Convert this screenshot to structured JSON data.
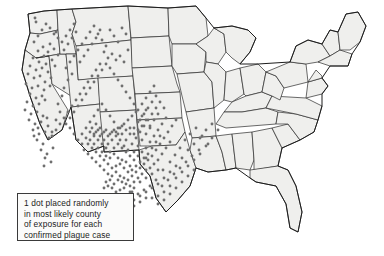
{
  "figure": {
    "kind": "choropleth-dot-map",
    "region": "Contiguous United States",
    "background_color": "#ffffff",
    "state_fill_color": "#efefed",
    "state_border_color": "#2b2b2b",
    "dot_color": "#6f6f6f"
  },
  "legend": {
    "box_border_color": "#3a3a3a",
    "box_fill_color": "#fbfbfa",
    "line1": "1 dot placed randomly",
    "line2": "in most likely county",
    "line3": "of exposure for each",
    "line4": "confirmed plague case"
  },
  "chart_data": {
    "type": "scatter",
    "title": "",
    "xlabel": "",
    "ylabel": "",
    "units": "1 dot = 1 confirmed plague case",
    "total_dots": 392,
    "xlim": [
      0,
      384
    ],
    "ylim": [
      0,
      256
    ],
    "grid": false,
    "legend_position": "bottom-left",
    "clusters": [
      {
        "name": "Four Corners / New Mexico-Arizona-Colorado core",
        "dot_count": 243
      },
      {
        "name": "California coastal and Sierra",
        "dot_count": 63
      },
      {
        "name": "Oregon / Washington",
        "dot_count": 18
      },
      {
        "name": "Nevada / Utah / Idaho",
        "dot_count": 24
      },
      {
        "name": "Montana / Wyoming",
        "dot_count": 14
      },
      {
        "name": "Texas / Oklahoma outliers",
        "dot_count": 8
      }
    ],
    "points": [
      [
        35,
        18
      ],
      [
        36,
        22
      ],
      [
        56,
        32
      ],
      [
        50,
        44
      ],
      [
        43,
        47
      ],
      [
        38,
        51
      ],
      [
        48,
        52
      ],
      [
        54,
        49
      ],
      [
        44,
        56
      ],
      [
        58,
        55
      ],
      [
        33,
        58
      ],
      [
        39,
        62
      ],
      [
        46,
        64
      ],
      [
        52,
        60
      ],
      [
        30,
        66
      ],
      [
        36,
        70
      ],
      [
        42,
        68
      ],
      [
        48,
        72
      ],
      [
        55,
        66
      ],
      [
        28,
        74
      ],
      [
        34,
        78
      ],
      [
        40,
        76
      ],
      [
        45,
        82
      ],
      [
        51,
        78
      ],
      [
        26,
        84
      ],
      [
        32,
        88
      ],
      [
        38,
        86
      ],
      [
        44,
        90
      ],
      [
        50,
        86
      ],
      [
        30,
        94
      ],
      [
        36,
        98
      ],
      [
        42,
        96
      ],
      [
        27,
        102
      ],
      [
        33,
        106
      ],
      [
        39,
        104
      ],
      [
        45,
        100
      ],
      [
        25,
        110
      ],
      [
        31,
        114
      ],
      [
        37,
        112
      ],
      [
        43,
        116
      ],
      [
        29,
        120
      ],
      [
        35,
        124
      ],
      [
        41,
        122
      ],
      [
        47,
        118
      ],
      [
        33,
        130
      ],
      [
        39,
        134
      ],
      [
        45,
        132
      ],
      [
        37,
        140
      ],
      [
        43,
        144
      ],
      [
        49,
        138
      ],
      [
        41,
        150
      ],
      [
        47,
        154
      ],
      [
        53,
        148
      ],
      [
        45,
        158
      ],
      [
        51,
        162
      ],
      [
        44,
        166
      ],
      [
        38,
        128
      ],
      [
        34,
        136
      ],
      [
        48,
        126
      ],
      [
        52,
        132
      ],
      [
        56,
        120
      ],
      [
        60,
        112
      ],
      [
        58,
        104
      ],
      [
        62,
        96
      ],
      [
        64,
        88
      ],
      [
        68,
        80
      ],
      [
        72,
        74
      ],
      [
        66,
        68
      ],
      [
        70,
        62
      ],
      [
        74,
        56
      ],
      [
        78,
        50
      ],
      [
        82,
        44
      ],
      [
        86,
        38
      ],
      [
        90,
        32
      ],
      [
        94,
        26
      ],
      [
        98,
        34
      ],
      [
        102,
        40
      ],
      [
        106,
        46
      ],
      [
        110,
        30
      ],
      [
        114,
        36
      ],
      [
        118,
        42
      ],
      [
        122,
        28
      ],
      [
        126,
        34
      ],
      [
        104,
        52
      ],
      [
        108,
        58
      ],
      [
        112,
        54
      ],
      [
        116,
        60
      ],
      [
        120,
        56
      ],
      [
        124,
        62
      ],
      [
        128,
        50
      ],
      [
        100,
        64
      ],
      [
        96,
        70
      ],
      [
        92,
        76
      ],
      [
        88,
        82
      ],
      [
        84,
        88
      ],
      [
        80,
        94
      ],
      [
        76,
        100
      ],
      [
        72,
        106
      ],
      [
        68,
        112
      ],
      [
        64,
        118
      ],
      [
        60,
        124
      ],
      [
        56,
        130
      ],
      [
        52,
        136
      ],
      [
        66,
        124
      ],
      [
        70,
        118
      ],
      [
        74,
        112
      ],
      [
        78,
        106
      ],
      [
        82,
        100
      ],
      [
        86,
        94
      ],
      [
        90,
        88
      ],
      [
        94,
        82
      ],
      [
        98,
        76
      ],
      [
        102,
        70
      ],
      [
        106,
        64
      ],
      [
        110,
        68
      ],
      [
        114,
        74
      ],
      [
        118,
        80
      ],
      [
        122,
        86
      ],
      [
        126,
        92
      ],
      [
        130,
        98
      ],
      [
        134,
        104
      ],
      [
        138,
        110
      ],
      [
        142,
        104
      ],
      [
        146,
        98
      ],
      [
        150,
        92
      ],
      [
        154,
        86
      ],
      [
        146,
        110
      ],
      [
        142,
        116
      ],
      [
        138,
        122
      ],
      [
        134,
        128
      ],
      [
        130,
        134
      ],
      [
        126,
        140
      ],
      [
        122,
        134
      ],
      [
        118,
        128
      ],
      [
        114,
        122
      ],
      [
        110,
        116
      ],
      [
        106,
        110
      ],
      [
        102,
        104
      ],
      [
        98,
        110
      ],
      [
        94,
        116
      ],
      [
        90,
        122
      ],
      [
        86,
        128
      ],
      [
        82,
        134
      ],
      [
        78,
        140
      ],
      [
        74,
        134
      ],
      [
        70,
        128
      ],
      [
        96,
        124
      ],
      [
        100,
        128
      ],
      [
        104,
        132
      ],
      [
        108,
        136
      ],
      [
        112,
        132
      ],
      [
        116,
        136
      ],
      [
        120,
        140
      ],
      [
        124,
        146
      ],
      [
        128,
        150
      ],
      [
        132,
        144
      ],
      [
        136,
        138
      ],
      [
        140,
        132
      ],
      [
        144,
        126
      ],
      [
        148,
        120
      ],
      [
        152,
        114
      ],
      [
        156,
        108
      ],
      [
        150,
        128
      ],
      [
        146,
        134
      ],
      [
        142,
        140
      ],
      [
        138,
        146
      ],
      [
        134,
        152
      ],
      [
        130,
        156
      ],
      [
        126,
        152
      ],
      [
        122,
        148
      ],
      [
        118,
        144
      ],
      [
        114,
        148
      ],
      [
        110,
        152
      ],
      [
        106,
        148
      ],
      [
        102,
        144
      ],
      [
        98,
        140
      ],
      [
        94,
        136
      ],
      [
        90,
        132
      ],
      [
        86,
        138
      ],
      [
        82,
        144
      ],
      [
        92,
        128
      ],
      [
        96,
        132
      ],
      [
        100,
        136
      ],
      [
        104,
        140
      ],
      [
        108,
        144
      ],
      [
        112,
        140
      ],
      [
        116,
        132
      ],
      [
        120,
        128
      ],
      [
        124,
        124
      ],
      [
        128,
        120
      ],
      [
        132,
        116
      ],
      [
        136,
        112
      ],
      [
        140,
        120
      ],
      [
        144,
        114
      ],
      [
        148,
        108
      ],
      [
        152,
        102
      ],
      [
        156,
        96
      ],
      [
        160,
        102
      ],
      [
        164,
        108
      ],
      [
        158,
        114
      ],
      [
        154,
        120
      ],
      [
        150,
        126
      ],
      [
        146,
        120
      ],
      [
        142,
        126
      ],
      [
        138,
        130
      ],
      [
        134,
        134
      ],
      [
        130,
        128
      ],
      [
        126,
        130
      ],
      [
        122,
        126
      ],
      [
        118,
        134
      ],
      [
        114,
        130
      ],
      [
        110,
        134
      ],
      [
        106,
        130
      ],
      [
        102,
        134
      ],
      [
        98,
        130
      ],
      [
        94,
        134
      ],
      [
        90,
        140
      ],
      [
        94,
        144
      ],
      [
        98,
        148
      ],
      [
        102,
        152
      ],
      [
        106,
        156
      ],
      [
        110,
        158
      ],
      [
        114,
        154
      ],
      [
        118,
        158
      ],
      [
        122,
        160
      ],
      [
        126,
        162
      ],
      [
        130,
        166
      ],
      [
        134,
        160
      ],
      [
        138,
        156
      ],
      [
        142,
        152
      ],
      [
        146,
        148
      ],
      [
        150,
        142
      ],
      [
        154,
        136
      ],
      [
        158,
        130
      ],
      [
        162,
        124
      ],
      [
        166,
        118
      ],
      [
        160,
        136
      ],
      [
        156,
        142
      ],
      [
        152,
        148
      ],
      [
        148,
        154
      ],
      [
        144,
        158
      ],
      [
        140,
        162
      ],
      [
        136,
        166
      ],
      [
        132,
        170
      ],
      [
        128,
        172
      ],
      [
        124,
        168
      ],
      [
        120,
        164
      ],
      [
        116,
        166
      ],
      [
        112,
        168
      ],
      [
        108,
        164
      ],
      [
        104,
        160
      ],
      [
        100,
        156
      ],
      [
        96,
        152
      ],
      [
        92,
        148
      ],
      [
        88,
        144
      ],
      [
        84,
        150
      ],
      [
        88,
        154
      ],
      [
        92,
        158
      ],
      [
        96,
        162
      ],
      [
        100,
        166
      ],
      [
        104,
        170
      ],
      [
        108,
        174
      ],
      [
        112,
        176
      ],
      [
        116,
        172
      ],
      [
        120,
        176
      ],
      [
        124,
        178
      ],
      [
        128,
        180
      ],
      [
        132,
        176
      ],
      [
        136,
        172
      ],
      [
        140,
        168
      ],
      [
        144,
        164
      ],
      [
        148,
        160
      ],
      [
        152,
        156
      ],
      [
        156,
        150
      ],
      [
        160,
        144
      ],
      [
        164,
        138
      ],
      [
        168,
        132
      ],
      [
        172,
        126
      ],
      [
        176,
        120
      ],
      [
        170,
        142
      ],
      [
        166,
        148
      ],
      [
        162,
        154
      ],
      [
        158,
        160
      ],
      [
        154,
        164
      ],
      [
        150,
        168
      ],
      [
        146,
        170
      ],
      [
        142,
        174
      ],
      [
        138,
        178
      ],
      [
        134,
        182
      ],
      [
        130,
        186
      ],
      [
        126,
        184
      ],
      [
        122,
        182
      ],
      [
        118,
        180
      ],
      [
        114,
        184
      ],
      [
        110,
        180
      ],
      [
        106,
        182
      ],
      [
        163,
        170
      ],
      [
        170,
        162
      ],
      [
        175,
        155
      ],
      [
        180,
        148
      ],
      [
        185,
        140
      ],
      [
        190,
        134
      ],
      [
        196,
        128
      ],
      [
        202,
        136
      ],
      [
        208,
        144
      ],
      [
        199,
        150
      ],
      [
        192,
        156
      ],
      [
        186,
        162
      ],
      [
        180,
        168
      ],
      [
        174,
        174
      ],
      [
        168,
        180
      ],
      [
        162,
        186
      ],
      [
        156,
        180
      ],
      [
        150,
        186
      ],
      [
        144,
        190
      ],
      [
        138,
        194
      ],
      [
        132,
        192
      ],
      [
        128,
        196
      ],
      [
        158,
        170
      ],
      [
        152,
        174
      ],
      [
        146,
        178
      ],
      [
        140,
        182
      ],
      [
        134,
        188
      ],
      [
        130,
        192
      ],
      [
        124,
        188
      ],
      [
        120,
        190
      ],
      [
        116,
        192
      ],
      [
        112,
        188
      ],
      [
        108,
        186
      ],
      [
        104,
        188
      ],
      [
        116,
        196
      ],
      [
        122,
        200
      ],
      [
        128,
        204
      ],
      [
        134,
        200
      ],
      [
        140,
        196
      ],
      [
        146,
        192
      ],
      [
        152,
        188
      ],
      [
        158,
        184
      ],
      [
        164,
        178
      ],
      [
        170,
        172
      ],
      [
        176,
        166
      ],
      [
        182,
        158
      ],
      [
        188,
        150
      ],
      [
        194,
        144
      ],
      [
        200,
        138
      ],
      [
        206,
        130
      ],
      [
        212,
        124
      ],
      [
        218,
        130
      ],
      [
        212,
        138
      ],
      [
        206,
        146
      ],
      [
        200,
        154
      ],
      [
        194,
        160
      ],
      [
        188,
        166
      ],
      [
        182,
        172
      ],
      [
        176,
        178
      ],
      [
        170,
        186
      ],
      [
        164,
        192
      ],
      [
        158,
        196
      ],
      [
        152,
        198
      ],
      [
        146,
        198
      ],
      [
        140,
        202
      ],
      [
        134,
        206
      ],
      [
        128,
        208
      ],
      [
        158,
        204
      ],
      [
        164,
        200
      ],
      [
        170,
        194
      ],
      [
        176,
        188
      ],
      [
        182,
        182
      ],
      [
        188,
        176
      ],
      [
        194,
        170
      ],
      [
        146,
        158
      ],
      [
        80,
        62
      ],
      [
        84,
        56
      ],
      [
        88,
        50
      ],
      [
        92,
        44
      ],
      [
        96,
        38
      ],
      [
        100,
        30
      ],
      [
        62,
        42
      ],
      [
        66,
        36
      ],
      [
        70,
        30
      ],
      [
        74,
        24
      ],
      [
        64,
        50
      ],
      [
        68,
        44
      ],
      [
        72,
        38
      ],
      [
        76,
        32
      ],
      [
        58,
        38
      ],
      [
        54,
        34
      ],
      [
        50,
        28
      ],
      [
        46,
        24
      ],
      [
        42,
        30
      ],
      [
        38,
        36
      ],
      [
        34,
        42
      ]
    ]
  }
}
